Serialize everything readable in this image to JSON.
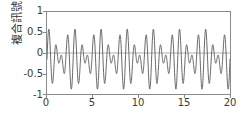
{
  "chart_data": {
    "type": "line",
    "title": "",
    "xlabel": "",
    "ylabel": "複合訊號",
    "xlim": [
      0,
      20
    ],
    "ylim": [
      -1,
      1
    ],
    "xticks": [
      0,
      5,
      10,
      15,
      20
    ],
    "xticklabels": [
      "0",
      "5",
      "10",
      "15",
      "20"
    ],
    "yticks": [
      -1,
      -0.5,
      0,
      0.5,
      1
    ],
    "yticklabels": [
      "-1",
      "-0.5",
      "0",
      "0.5",
      "1"
    ],
    "grid": false,
    "legend": false,
    "zero_line": true,
    "line_color": "#555555",
    "frame_color": "#8a8a8a",
    "background": "#ffffff",
    "series": [
      {
        "name": "複合訊號",
        "formula": "0.4*sin(2*pi*1.4*x) + 0.35*sin(2*pi*1.05*x) - 0.15",
        "samples": 1400,
        "x_start": 0,
        "x_end": 20,
        "peak_value": 0.55,
        "trough_value": -0.74,
        "beat_period": 2.86,
        "components": [
          {
            "amplitude": 0.4,
            "frequency": 1.4,
            "phase": 0
          },
          {
            "amplitude": 0.35,
            "frequency": 1.05,
            "phase": 0
          }
        ],
        "offset": -0.15
      }
    ]
  }
}
